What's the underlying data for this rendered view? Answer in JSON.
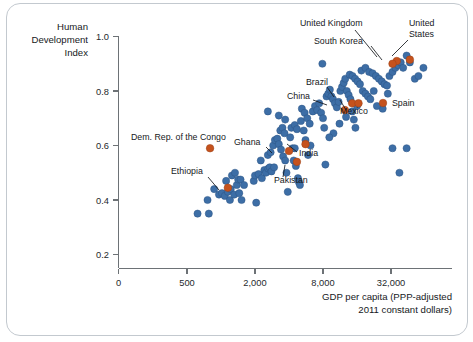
{
  "chart_data": {
    "type": "scatter",
    "title": "",
    "xlabel": "GDP per capita (PPP-adjusted 2011 constant dollars)",
    "ylabel": "Human Development Index",
    "ylabel_lines": [
      "Human",
      "Development",
      "Index"
    ],
    "xlabel_lines": [
      "GDP per capita (PPP-adjusted",
      "2011 constant dollars)"
    ],
    "x_scale": "log",
    "x_ticks": [
      0,
      500,
      2000,
      8000,
      32000
    ],
    "x_tick_labels": [
      "0",
      "500",
      "2,000",
      "8,000",
      "32,000"
    ],
    "y_ticks": [
      0.2,
      0.4,
      0.6,
      0.8,
      1.0
    ],
    "y_tick_labels": [
      "0.2",
      "0.4",
      "0.6",
      "0.8",
      "1.0"
    ],
    "ylim": [
      0.15,
      1.02
    ],
    "grid": false,
    "legend": "none",
    "series": [
      {
        "name": "Countries",
        "color": "#3d6ea6",
        "points": [
          {
            "x": 620,
            "y": 0.35
          },
          {
            "x": 780,
            "y": 0.35
          },
          {
            "x": 760,
            "y": 0.4
          },
          {
            "x": 870,
            "y": 0.44
          },
          {
            "x": 960,
            "y": 0.42
          },
          {
            "x": 1020,
            "y": 0.425
          },
          {
            "x": 1080,
            "y": 0.415
          },
          {
            "x": 1150,
            "y": 0.43
          },
          {
            "x": 1220,
            "y": 0.44
          },
          {
            "x": 1200,
            "y": 0.4
          },
          {
            "x": 1310,
            "y": 0.42
          },
          {
            "x": 1380,
            "y": 0.455
          },
          {
            "x": 1450,
            "y": 0.425
          },
          {
            "x": 1520,
            "y": 0.4
          },
          {
            "x": 1110,
            "y": 0.47
          },
          {
            "x": 1250,
            "y": 0.49
          },
          {
            "x": 1330,
            "y": 0.5
          },
          {
            "x": 1420,
            "y": 0.475
          },
          {
            "x": 1490,
            "y": 0.475
          },
          {
            "x": 1600,
            "y": 0.455
          },
          {
            "x": 2050,
            "y": 0.39
          },
          {
            "x": 1950,
            "y": 0.47
          },
          {
            "x": 2000,
            "y": 0.49
          },
          {
            "x": 2150,
            "y": 0.495
          },
          {
            "x": 2300,
            "y": 0.48
          },
          {
            "x": 2250,
            "y": 0.545
          },
          {
            "x": 2420,
            "y": 0.51
          },
          {
            "x": 2500,
            "y": 0.5
          },
          {
            "x": 2620,
            "y": 0.515
          },
          {
            "x": 2700,
            "y": 0.52
          },
          {
            "x": 2800,
            "y": 0.505
          },
          {
            "x": 2950,
            "y": 0.52
          },
          {
            "x": 2600,
            "y": 0.565
          },
          {
            "x": 2750,
            "y": 0.575
          },
          {
            "x": 2900,
            "y": 0.6
          },
          {
            "x": 3000,
            "y": 0.62
          },
          {
            "x": 3150,
            "y": 0.625
          },
          {
            "x": 3250,
            "y": 0.605
          },
          {
            "x": 3400,
            "y": 0.585
          },
          {
            "x": 3550,
            "y": 0.56
          },
          {
            "x": 3700,
            "y": 0.545
          },
          {
            "x": 3800,
            "y": 0.5
          },
          {
            "x": 3900,
            "y": 0.43
          },
          {
            "x": 3350,
            "y": 0.655
          },
          {
            "x": 3500,
            "y": 0.665
          },
          {
            "x": 3650,
            "y": 0.645
          },
          {
            "x": 2600,
            "y": 0.725
          },
          {
            "x": 3250,
            "y": 0.71
          },
          {
            "x": 3700,
            "y": 0.695
          },
          {
            "x": 4100,
            "y": 0.63
          },
          {
            "x": 4300,
            "y": 0.59
          },
          {
            "x": 4400,
            "y": 0.545
          },
          {
            "x": 4600,
            "y": 0.525
          },
          {
            "x": 4800,
            "y": 0.48
          },
          {
            "x": 4900,
            "y": 0.465
          },
          {
            "x": 5000,
            "y": 0.455
          },
          {
            "x": 4200,
            "y": 0.665
          },
          {
            "x": 4500,
            "y": 0.675
          },
          {
            "x": 4700,
            "y": 0.66
          },
          {
            "x": 5100,
            "y": 0.69
          },
          {
            "x": 5400,
            "y": 0.655
          },
          {
            "x": 5600,
            "y": 0.62
          },
          {
            "x": 5200,
            "y": 0.735
          },
          {
            "x": 5500,
            "y": 0.72
          },
          {
            "x": 5800,
            "y": 0.7
          },
          {
            "x": 6100,
            "y": 0.68
          },
          {
            "x": 6500,
            "y": 0.725
          },
          {
            "x": 6800,
            "y": 0.745
          },
          {
            "x": 7100,
            "y": 0.73
          },
          {
            "x": 7400,
            "y": 0.755
          },
          {
            "x": 7700,
            "y": 0.72
          },
          {
            "x": 8000,
            "y": 0.7
          },
          {
            "x": 8200,
            "y": 0.665
          },
          {
            "x": 8400,
            "y": 0.53
          },
          {
            "x": 7900,
            "y": 0.9
          },
          {
            "x": 8600,
            "y": 0.78
          },
          {
            "x": 8900,
            "y": 0.79
          },
          {
            "x": 9200,
            "y": 0.805
          },
          {
            "x": 9500,
            "y": 0.78
          },
          {
            "x": 9800,
            "y": 0.77
          },
          {
            "x": 10200,
            "y": 0.755
          },
          {
            "x": 10600,
            "y": 0.74
          },
          {
            "x": 11000,
            "y": 0.76
          },
          {
            "x": 11400,
            "y": 0.8
          },
          {
            "x": 11800,
            "y": 0.815
          },
          {
            "x": 12200,
            "y": 0.83
          },
          {
            "x": 12600,
            "y": 0.845
          },
          {
            "x": 13000,
            "y": 0.8
          },
          {
            "x": 13500,
            "y": 0.785
          },
          {
            "x": 14000,
            "y": 0.77
          },
          {
            "x": 14500,
            "y": 0.725
          },
          {
            "x": 15000,
            "y": 0.695
          },
          {
            "x": 15500,
            "y": 0.665
          },
          {
            "x": 13800,
            "y": 0.86
          },
          {
            "x": 14600,
            "y": 0.855
          },
          {
            "x": 15400,
            "y": 0.845
          },
          {
            "x": 16200,
            "y": 0.835
          },
          {
            "x": 17000,
            "y": 0.825
          },
          {
            "x": 18000,
            "y": 0.8
          },
          {
            "x": 19000,
            "y": 0.79
          },
          {
            "x": 20000,
            "y": 0.78
          },
          {
            "x": 21000,
            "y": 0.77
          },
          {
            "x": 17500,
            "y": 0.875
          },
          {
            "x": 19000,
            "y": 0.885
          },
          {
            "x": 20500,
            "y": 0.87
          },
          {
            "x": 22000,
            "y": 0.865
          },
          {
            "x": 23500,
            "y": 0.855
          },
          {
            "x": 25000,
            "y": 0.845
          },
          {
            "x": 26500,
            "y": 0.835
          },
          {
            "x": 28000,
            "y": 0.825
          },
          {
            "x": 29500,
            "y": 0.82
          },
          {
            "x": 31000,
            "y": 0.855
          },
          {
            "x": 33000,
            "y": 0.87
          },
          {
            "x": 35000,
            "y": 0.885
          },
          {
            "x": 37000,
            "y": 0.895
          },
          {
            "x": 39000,
            "y": 0.905
          },
          {
            "x": 41000,
            "y": 0.885
          },
          {
            "x": 44000,
            "y": 0.93
          },
          {
            "x": 47000,
            "y": 0.905
          },
          {
            "x": 52000,
            "y": 0.845
          },
          {
            "x": 56000,
            "y": 0.855
          },
          {
            "x": 62000,
            "y": 0.885
          },
          {
            "x": 33000,
            "y": 0.59
          },
          {
            "x": 44000,
            "y": 0.59
          },
          {
            "x": 38000,
            "y": 0.5
          },
          {
            "x": 30000,
            "y": 0.79
          },
          {
            "x": 27000,
            "y": 0.735
          },
          {
            "x": 24000,
            "y": 0.745
          },
          {
            "x": 22500,
            "y": 0.8
          },
          {
            "x": 16000,
            "y": 0.745
          },
          {
            "x": 12800,
            "y": 0.705
          },
          {
            "x": 11200,
            "y": 0.68
          },
          {
            "x": 9900,
            "y": 0.645
          },
          {
            "x": 9100,
            "y": 0.63
          },
          {
            "x": 6200,
            "y": 0.6
          },
          {
            "x": 5900,
            "y": 0.565
          },
          {
            "x": 4500,
            "y": 0.59
          }
        ]
      }
    ],
    "highlighted": [
      {
        "name": "United Kingdom",
        "x": 36000,
        "y": 0.91,
        "color": "#c5521d",
        "label_x": 300,
        "label_y": 26,
        "leader": [
          [
            355,
            30
          ],
          [
            377,
            57
          ]
        ],
        "anchor": "start"
      },
      {
        "name": "United States",
        "x": 47000,
        "y": 0.915,
        "color": "#c5521d",
        "label_x": 409,
        "label_y": 26,
        "label2_y": 37,
        "leader": [
          [
            408,
            40
          ],
          [
            392,
            56
          ]
        ],
        "anchor": "start"
      },
      {
        "name": "South Korea",
        "x": 33000,
        "y": 0.9,
        "color": "#c5521d",
        "label_x": 314,
        "label_y": 44,
        "leader": [
          [
            371,
            46
          ],
          [
            382,
            60
          ]
        ],
        "anchor": "start"
      },
      {
        "name": "Brazil",
        "x": 14500,
        "y": 0.755,
        "color": "#c5521d",
        "label_x": 306,
        "label_y": 85,
        "leader": [
          [
            327,
            87
          ],
          [
            334,
            97
          ]
        ],
        "anchor": "start"
      },
      {
        "name": "China",
        "x": 12500,
        "y": 0.73,
        "color": "#c5521d",
        "label_x": 287,
        "label_y": 99,
        "leader": [
          [
            313,
            100
          ],
          [
            327,
            105
          ]
        ],
        "anchor": "start"
      },
      {
        "name": "Mexico",
        "x": 16500,
        "y": 0.755,
        "color": "#c5521d",
        "label_x": 340,
        "label_y": 114,
        "leader": [
          [
            346,
            110
          ],
          [
            340,
            100
          ]
        ],
        "anchor": "start"
      },
      {
        "name": "Spain",
        "x": 31000,
        "y": 0.755,
        "color": "#c5521d",
        "label_x": 392,
        "label_y": 106,
        "dot_x": 383,
        "dot_y": 103,
        "anchor": "start"
      },
      {
        "name": "Dem. Rep. of the Congo",
        "x": 800,
        "y": 0.59,
        "color": "#c5521d",
        "label_x": 131,
        "label_y": 140,
        "leader": null,
        "anchor": "start"
      },
      {
        "name": "Ghana",
        "x": 4000,
        "y": 0.58,
        "color": "#c5521d",
        "label_x": 234,
        "label_y": 145,
        "leader": [
          [
            266,
            147
          ],
          [
            272,
            153
          ]
        ],
        "anchor": "start"
      },
      {
        "name": "India",
        "x": 5600,
        "y": 0.605,
        "color": "#c5521d",
        "label_x": 299,
        "label_y": 156,
        "leader": [
          [
            297,
            152
          ],
          [
            287,
            144
          ]
        ],
        "anchor": "start"
      },
      {
        "name": "Pakistan",
        "x": 4700,
        "y": 0.54,
        "color": "#c5521d",
        "label_x": 274,
        "label_y": 183,
        "leader": [
          [
            283,
            177
          ],
          [
            285,
            165
          ]
        ],
        "anchor": "start"
      },
      {
        "name": "Ethiopia",
        "x": 1150,
        "y": 0.445,
        "color": "#c5521d",
        "label_x": 171,
        "label_y": 174,
        "leader": [
          [
            208,
            177
          ],
          [
            219,
            190
          ]
        ],
        "anchor": "start"
      }
    ]
  },
  "colors": {
    "blue": "#3d6ea6",
    "orange": "#c5521d",
    "axis": "#6d7276",
    "text": "#16191c",
    "frame": "#c3c9cf"
  }
}
